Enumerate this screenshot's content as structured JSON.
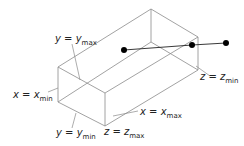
{
  "diagram": {
    "type": "clipping-volume",
    "colors": {
      "box_edge": "#8a8a8a",
      "line": "#222222",
      "point": "#000000",
      "label": "#222222",
      "leader": "#8a8a8a"
    },
    "labels": {
      "y_max": {
        "var": "y",
        "eq": "=",
        "base": "y",
        "sub": "max"
      },
      "x_min": {
        "var": "x",
        "eq": "=",
        "base": "x",
        "sub": "min"
      },
      "y_min": {
        "var": "y",
        "eq": "=",
        "base": "y",
        "sub": "min"
      },
      "z_max": {
        "var": "z",
        "eq": "=",
        "base": "z",
        "sub": "max"
      },
      "x_max": {
        "var": "x",
        "eq": "=",
        "base": "x",
        "sub": "max"
      },
      "z_min": {
        "var": "z",
        "eq": "=",
        "base": "z",
        "sub": "min"
      }
    },
    "points": [
      {
        "x": 124,
        "y": 50
      },
      {
        "x": 192,
        "y": 45
      },
      {
        "x": 226,
        "y": 43
      }
    ]
  }
}
